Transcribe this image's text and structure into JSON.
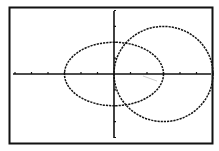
{
  "screen": {
    "kind": "graphing-calculator-graph-screen",
    "colors": {
      "background": "#ffffff",
      "ink": "#111111",
      "artifact": "#b8b8b8"
    }
  },
  "chart_data": {
    "type": "line",
    "title": "",
    "xlabel": "",
    "ylabel": "",
    "xlim": [
      -6,
      6
    ],
    "ylim": [
      -4,
      4
    ],
    "xscl": 1,
    "yscl": 1,
    "grid": false,
    "legend": null,
    "axes": {
      "x_ticks": [
        -6,
        -5,
        -4,
        -3,
        -2,
        -1,
        1,
        2,
        3,
        4,
        5,
        6
      ],
      "y_ticks": [
        -4,
        -3,
        -2,
        -1,
        1,
        2,
        3,
        4
      ]
    },
    "series": [
      {
        "name": "ellipse",
        "equation": "x^2/9 + y^2/4 = 1",
        "center": [
          0,
          0
        ],
        "rx": 3,
        "ry": 2,
        "style": "dotted-pixel"
      },
      {
        "name": "circle",
        "equation": "(x-3)^2 + y^2 = 9",
        "center": [
          3,
          0
        ],
        "rx": 3,
        "ry": 3,
        "style": "dotted-pixel"
      }
    ]
  }
}
